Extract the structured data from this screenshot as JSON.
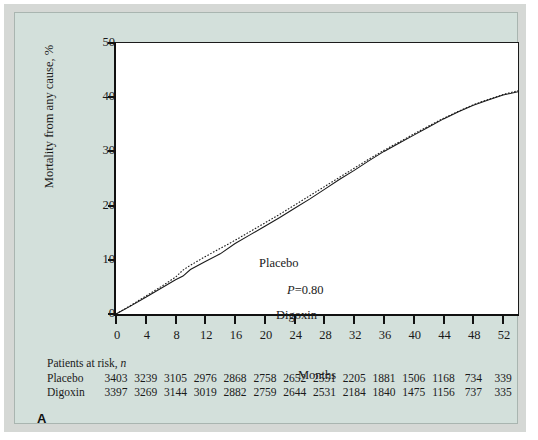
{
  "figure": {
    "panel_letter": "A",
    "annotation_pvalue": "P=0.80",
    "annotation_pvalue_prefix": "P",
    "annotation_pvalue_rest": "=0.80",
    "background_panel_color": "#d3e0db",
    "mat_color": "#d5d8d5",
    "plot_background": "#ffffff",
    "axis_color": "#111111"
  },
  "chart_data": {
    "type": "line",
    "title": "",
    "xlabel": "Months",
    "ylabel": "Mortality from any cause, %",
    "xlim": [
      0,
      54
    ],
    "ylim": [
      0,
      50
    ],
    "xticks": [
      0,
      4,
      8,
      12,
      16,
      20,
      24,
      28,
      32,
      36,
      40,
      44,
      48,
      52
    ],
    "xtick_labels": [
      "0",
      "4",
      "8",
      "12",
      "16",
      "20",
      "24",
      "28",
      "32",
      "36",
      "40",
      "44",
      "48",
      "52"
    ],
    "yticks": [
      0,
      10,
      20,
      30,
      40,
      50
    ],
    "ytick_labels": [
      "0",
      "10",
      "20",
      "30",
      "40",
      "50"
    ],
    "grid": false,
    "legend_position": "inline-curve-labels",
    "series": [
      {
        "name": "Placebo",
        "style": "dotted",
        "color": "#1a1a1a",
        "label_position": {
          "x": 9.5,
          "y": 13.2
        },
        "x": [
          0,
          2,
          4,
          6,
          8,
          9,
          10,
          12,
          14,
          16,
          18,
          20,
          22,
          24,
          26,
          28,
          30,
          32,
          34,
          36,
          38,
          40,
          42,
          44,
          46,
          48,
          50,
          52,
          54
        ],
        "y": [
          0.0,
          1.6,
          3.3,
          5.0,
          6.8,
          8.1,
          9.0,
          10.6,
          12.1,
          13.6,
          15.2,
          16.8,
          18.4,
          20.1,
          21.8,
          23.5,
          25.2,
          26.9,
          28.6,
          30.2,
          31.7,
          33.2,
          34.7,
          36.1,
          37.4,
          38.6,
          39.6,
          40.5,
          41.2
        ]
      },
      {
        "name": "Digoxin",
        "style": "solid",
        "color": "#1a1a1a",
        "label_position": {
          "x": 13.5,
          "y": 7.8
        },
        "x": [
          0,
          2,
          4,
          6,
          8,
          9,
          10,
          12,
          14,
          16,
          18,
          20,
          22,
          24,
          26,
          28,
          30,
          32,
          34,
          36,
          38,
          40,
          42,
          44,
          46,
          48,
          50,
          52,
          54
        ],
        "y": [
          0.0,
          1.5,
          3.1,
          4.7,
          6.3,
          7.0,
          8.2,
          9.7,
          11.1,
          13.0,
          14.6,
          16.2,
          17.8,
          19.5,
          21.2,
          23.0,
          24.8,
          26.5,
          28.3,
          30.0,
          31.5,
          33.0,
          34.5,
          36.0,
          37.3,
          38.5,
          39.5,
          40.4,
          41.0
        ]
      }
    ]
  },
  "risk_table": {
    "title_text": "Patients at risk, ",
    "title_italic": "n",
    "time_points": [
      0,
      4,
      8,
      12,
      16,
      20,
      24,
      28,
      32,
      36,
      40,
      44,
      48,
      52
    ],
    "rows": [
      {
        "name": "Placebo",
        "values": [
          "3403",
          "3239",
          "3105",
          "2976",
          "2868",
          "2758",
          "2652",
          "2551",
          "2205",
          "1881",
          "1506",
          "1168",
          "734",
          "339"
        ]
      },
      {
        "name": "Digoxin",
        "values": [
          "3397",
          "3269",
          "3144",
          "3019",
          "2882",
          "2759",
          "2644",
          "2531",
          "2184",
          "1840",
          "1475",
          "1156",
          "737",
          "335"
        ]
      }
    ]
  }
}
